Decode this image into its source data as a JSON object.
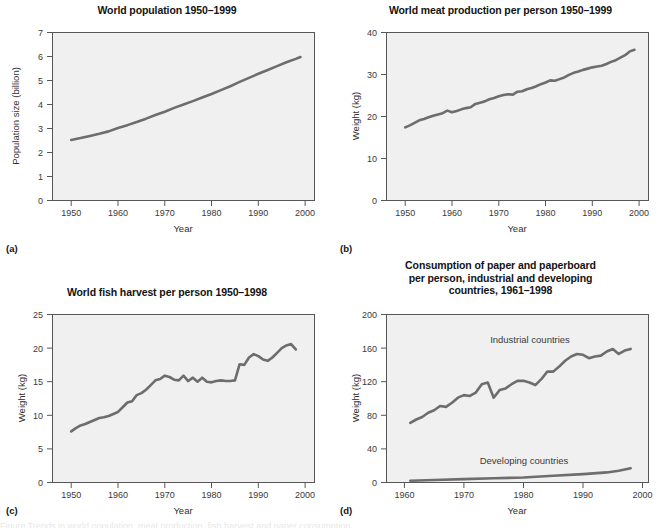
{
  "figure": {
    "background_color": "#ffffff",
    "line_color": "#6d6d6d",
    "plot_background_color": "#f0f0f0",
    "axis_color": "#575757",
    "caption_fragment": "Figure   Trends in world population, meat production, fish harvest and paper consumption"
  },
  "panels": [
    {
      "letter": "(a)",
      "title": "World population 1950–1999",
      "chart_data": {
        "type": "line",
        "title": "World population 1950–1999",
        "xlabel": "Year",
        "ylabel": "Population size (billion)",
        "xlim": [
          1946,
          2002
        ],
        "ylim": [
          0,
          7
        ],
        "xticks": [
          1950,
          1960,
          1970,
          1980,
          1990,
          2000
        ],
        "yticks": [
          0,
          1,
          2,
          3,
          4,
          5,
          6,
          7
        ],
        "grid": false,
        "legend": "none",
        "series": [
          {
            "name": "World population",
            "x": [
              1950,
              1952,
              1954,
              1956,
              1958,
              1960,
              1962,
              1964,
              1966,
              1968,
              1970,
              1972,
              1974,
              1976,
              1978,
              1980,
              1982,
              1984,
              1986,
              1988,
              1990,
              1992,
              1994,
              1996,
              1998,
              1999
            ],
            "values": [
              2.52,
              2.6,
              2.69,
              2.78,
              2.88,
              3.02,
              3.14,
              3.27,
              3.41,
              3.56,
              3.7,
              3.86,
              4.0,
              4.14,
              4.29,
              4.44,
              4.6,
              4.76,
              4.94,
              5.11,
              5.28,
              5.44,
              5.6,
              5.76,
              5.9,
              5.98
            ]
          }
        ]
      }
    },
    {
      "letter": "(b)",
      "title": "World meat production per person 1950–1999",
      "chart_data": {
        "type": "line",
        "title": "World meat production per person 1950–1999",
        "xlabel": "Year",
        "ylabel": "Weight (kg)",
        "xlim": [
          1946,
          2002
        ],
        "ylim": [
          0,
          40
        ],
        "xticks": [
          1950,
          1960,
          1970,
          1980,
          1990,
          2000
        ],
        "yticks": [
          0,
          10,
          20,
          30,
          40
        ],
        "grid": false,
        "legend": "none",
        "series": [
          {
            "name": "Meat production per person",
            "x": [
              1950,
              1951,
              1952,
              1953,
              1954,
              1955,
              1956,
              1957,
              1958,
              1959,
              1960,
              1961,
              1962,
              1963,
              1964,
              1965,
              1966,
              1967,
              1968,
              1969,
              1970,
              1971,
              1972,
              1973,
              1974,
              1975,
              1976,
              1977,
              1978,
              1979,
              1980,
              1981,
              1982,
              1983,
              1984,
              1985,
              1986,
              1987,
              1988,
              1989,
              1990,
              1991,
              1992,
              1993,
              1994,
              1995,
              1996,
              1997,
              1998,
              1999
            ],
            "values": [
              17.4,
              17.9,
              18.5,
              19.1,
              19.4,
              19.8,
              20.2,
              20.5,
              20.8,
              21.4,
              21.0,
              21.3,
              21.7,
              22.0,
              22.2,
              23.0,
              23.3,
              23.6,
              24.1,
              24.4,
              24.8,
              25.1,
              25.3,
              25.2,
              25.9,
              26.0,
              26.5,
              26.8,
              27.2,
              27.7,
              28.1,
              28.6,
              28.5,
              28.9,
              29.3,
              29.9,
              30.4,
              30.7,
              31.1,
              31.4,
              31.7,
              31.9,
              32.1,
              32.5,
              33.0,
              33.4,
              34.0,
              34.6,
              35.5,
              35.9
            ]
          }
        ]
      }
    },
    {
      "letter": "(c)",
      "title": "World fish harvest per person 1950–1998",
      "chart_data": {
        "type": "line",
        "title": "World fish harvest per person 1950–1998",
        "xlabel": "Year",
        "ylabel": "Weight (kg)",
        "xlim": [
          1946,
          2002
        ],
        "ylim": [
          0,
          25
        ],
        "xticks": [
          1950,
          1960,
          1970,
          1980,
          1990,
          2000
        ],
        "yticks": [
          0,
          5,
          10,
          15,
          20,
          25
        ],
        "grid": false,
        "legend": "none",
        "series": [
          {
            "name": "Fish harvest per person",
            "x": [
              1950,
              1951,
              1952,
              1953,
              1954,
              1955,
              1956,
              1957,
              1958,
              1959,
              1960,
              1961,
              1962,
              1963,
              1964,
              1965,
              1966,
              1967,
              1968,
              1969,
              1970,
              1971,
              1972,
              1973,
              1974,
              1975,
              1976,
              1977,
              1978,
              1979,
              1980,
              1981,
              1982,
              1983,
              1984,
              1985,
              1986,
              1987,
              1988,
              1989,
              1990,
              1991,
              1992,
              1993,
              1994,
              1995,
              1996,
              1997,
              1998
            ],
            "values": [
              7.6,
              8.1,
              8.5,
              8.7,
              9.0,
              9.3,
              9.6,
              9.7,
              9.9,
              10.2,
              10.5,
              11.2,
              11.9,
              12.1,
              13.0,
              13.3,
              13.8,
              14.5,
              15.2,
              15.4,
              15.9,
              15.7,
              15.3,
              15.2,
              15.9,
              15.1,
              15.6,
              15.0,
              15.6,
              15.0,
              14.9,
              15.1,
              15.2,
              15.1,
              15.1,
              15.2,
              17.6,
              17.5,
              18.6,
              19.1,
              18.8,
              18.3,
              18.1,
              18.6,
              19.3,
              20.0,
              20.4,
              20.6,
              19.8
            ]
          }
        ]
      }
    },
    {
      "letter": "(d)",
      "title_lines": [
        "Consumption of paper and paperboard",
        "per person, industrial and developing",
        "countries, 1961–1998"
      ],
      "title": "Consumption of paper and paperboard per person, industrial and developing countries, 1961–1998",
      "chart_data": {
        "type": "line",
        "title": "Consumption of paper and paperboard per person, industrial and developing countries, 1961–1998",
        "xlabel": "Year",
        "ylabel": "Weight (kg)",
        "xlim": [
          1957,
          2001
        ],
        "ylim": [
          0,
          200
        ],
        "xticks": [
          1960,
          1970,
          1980,
          1990,
          2000
        ],
        "yticks": [
          0,
          40,
          80,
          120,
          160,
          200
        ],
        "grid": false,
        "legend": "inline-annotation",
        "annotations": [
          {
            "text": "Industrial countries",
            "x": 1980,
            "y": 168
          },
          {
            "text": "Developing countries",
            "x": 1979,
            "y": 30
          }
        ],
        "series": [
          {
            "name": "Industrial countries",
            "x": [
              1961,
              1962,
              1963,
              1964,
              1965,
              1966,
              1967,
              1968,
              1969,
              1970,
              1971,
              1972,
              1973,
              1974,
              1975,
              1976,
              1977,
              1978,
              1979,
              1980,
              1981,
              1982,
              1983,
              1984,
              1985,
              1986,
              1987,
              1988,
              1989,
              1990,
              1991,
              1992,
              1993,
              1994,
              1995,
              1996,
              1997,
              1998
            ],
            "values": [
              71,
              75,
              78,
              83,
              86,
              91,
              90,
              95,
              101,
              104,
              103,
              107,
              117,
              119,
              101,
              110,
              112,
              117,
              121,
              121,
              119,
              116,
              123,
              132,
              132,
              138,
              145,
              150,
              153,
              152,
              148,
              150,
              151,
              156,
              159,
              153,
              157,
              159
            ]
          },
          {
            "name": "Developing countries",
            "x": [
              1961,
              1965,
              1970,
              1975,
              1980,
              1985,
              1990,
              1994,
              1996,
              1998
            ],
            "values": [
              2,
              3,
              4,
              5,
              6,
              8,
              10,
              12,
              14,
              17
            ]
          }
        ]
      }
    }
  ]
}
